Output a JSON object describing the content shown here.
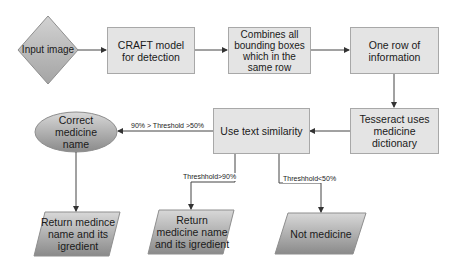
{
  "diagram": {
    "type": "flowchart",
    "nodes": {
      "input_image": {
        "label": "Input image",
        "shape": "diamond"
      },
      "craft": {
        "label": "CRAFT model for detection",
        "shape": "rectangle"
      },
      "combine": {
        "label": "Combines all bounding boxes which in the same row",
        "shape": "rectangle"
      },
      "one_row": {
        "label": "One row of information",
        "shape": "rectangle"
      },
      "tesseract": {
        "label": "Tesseract uses medicine dictionary",
        "shape": "rectangle"
      },
      "similarity": {
        "label": "Use text similarity",
        "shape": "rectangle"
      },
      "correct_name": {
        "label": "Correct medicine name",
        "shape": "ellipse"
      },
      "return_1": {
        "label": "Return medince name and its igredient",
        "shape": "parallelogram"
      },
      "return_2": {
        "label": "Return medicine name and its igredient",
        "shape": "parallelogram"
      },
      "not_medicine": {
        "label": "Not medicine",
        "shape": "parallelogram"
      }
    },
    "edges": {
      "e1": {
        "from": "input_image",
        "to": "craft",
        "label": ""
      },
      "e2": {
        "from": "craft",
        "to": "combine",
        "label": ""
      },
      "e3": {
        "from": "combine",
        "to": "one_row",
        "label": ""
      },
      "e4": {
        "from": "one_row",
        "to": "tesseract",
        "label": ""
      },
      "e5": {
        "from": "tesseract",
        "to": "similarity",
        "label": ""
      },
      "e6": {
        "from": "similarity",
        "to": "correct_name",
        "label": "90% > Threshold >50%"
      },
      "e7": {
        "from": "similarity",
        "to": "return_2",
        "label": "Threshhold>90%"
      },
      "e8": {
        "from": "similarity",
        "to": "not_medicine",
        "label": "Threshhold<50%"
      },
      "e9": {
        "from": "correct_name",
        "to": "return_1",
        "label": ""
      }
    },
    "colors": {
      "box_fill": "#e4e4e4",
      "box_border": "#a8a8a8",
      "shape_gradient_light": "#d6d6d6",
      "shape_gradient_dark": "#8c8c8c",
      "edge": "#444444"
    }
  }
}
